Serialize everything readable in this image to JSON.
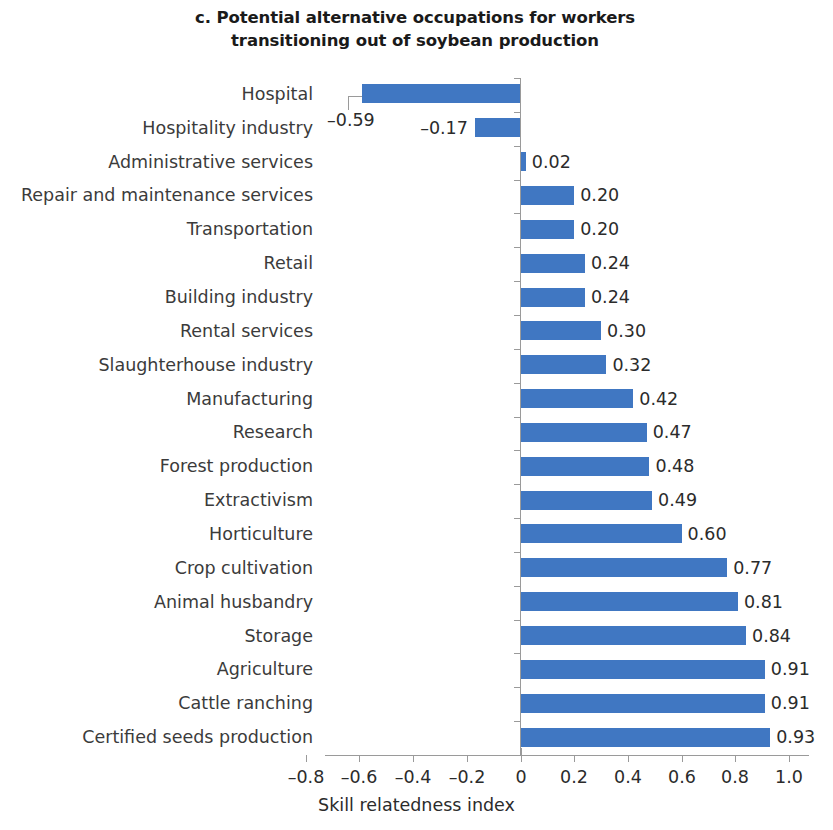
{
  "chart_data": {
    "type": "bar",
    "orientation": "horizontal",
    "title": "c. Potential alternative occupations for workers transitioning out of soybean production",
    "title_lines": [
      "c. Potential alternative occupations for workers",
      "transitioning out of soybean production"
    ],
    "xlabel": "Skill relatedness index",
    "ylabel": "",
    "xlim": [
      -0.9,
      1.05
    ],
    "xticks": [
      -0.8,
      -0.6,
      -0.4,
      -0.2,
      0,
      0.2,
      0.4,
      0.6,
      0.8,
      1.0
    ],
    "xtick_labels": [
      "–0.8",
      "–0.6",
      "–0.4",
      "–0.2",
      "0",
      "0.2",
      "0.4",
      "0.6",
      "0.8",
      "1.0"
    ],
    "grid": false,
    "legend": null,
    "bar_color": "#4077c2",
    "axis_color": "#9a9a9a",
    "categories": [
      "Hospital",
      "Hospitality industry",
      "Administrative services",
      "Repair and maintenance services",
      "Transportation",
      "Retail",
      "Building industry",
      "Rental services",
      "Slaughterhouse industry",
      "Manufacturing",
      "Research",
      "Forest production",
      "Extractivism",
      "Horticulture",
      "Crop cultivation",
      "Animal husbandry",
      "Storage",
      "Agriculture",
      "Cattle ranching",
      "Certified seeds production"
    ],
    "values": [
      -0.59,
      -0.17,
      0.02,
      0.2,
      0.2,
      0.24,
      0.24,
      0.3,
      0.32,
      0.42,
      0.47,
      0.48,
      0.49,
      0.6,
      0.77,
      0.81,
      0.84,
      0.91,
      0.91,
      0.93
    ],
    "value_labels": [
      "–0.59",
      "–0.17",
      "0.02",
      "0.20",
      "0.20",
      "0.24",
      "0.24",
      "0.30",
      "0.32",
      "0.42",
      "0.47",
      "0.48",
      "0.49",
      "0.60",
      "0.77",
      "0.81",
      "0.84",
      "0.91",
      "0.91",
      "0.93"
    ],
    "annotations": [
      {
        "text": "–0.59",
        "for_category": "Hospital",
        "type": "leader-line-callout",
        "note": "value label offset below-left of bar end, connected by an L-shaped leader line"
      }
    ]
  }
}
